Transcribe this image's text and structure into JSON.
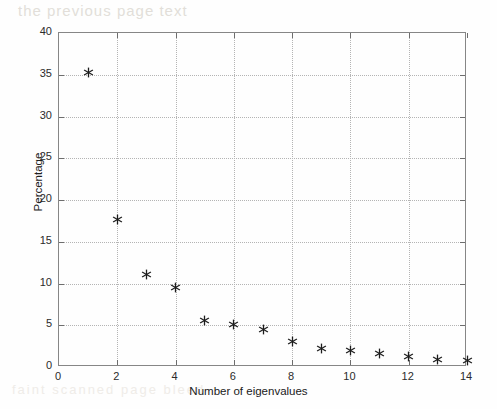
{
  "figure": {
    "background_color": "#fefefe",
    "axis_color": "#868686",
    "grid_color": "#b4b4b4",
    "marker_color": "#1d1d1d",
    "marker_symbol": "asterisk-marker"
  },
  "artifacts": {
    "top_bleed_text": "the previous page text",
    "bottom_bleed_text": "faint scanned page bleed"
  },
  "chart_data": {
    "type": "scatter",
    "title": "",
    "xlabel": "Number of eigenvalues",
    "ylabel": "Percentage",
    "xlim": [
      0,
      14
    ],
    "ylim": [
      0,
      40
    ],
    "xticks": [
      0,
      2,
      4,
      6,
      8,
      10,
      12,
      14
    ],
    "xticklabels": [
      "0",
      "2",
      "4",
      "6",
      "8",
      "10",
      "12",
      "14"
    ],
    "yticks": [
      0,
      5,
      10,
      15,
      20,
      25,
      30,
      35,
      40
    ],
    "yticklabels": [
      "0",
      "5",
      "10",
      "15",
      "20",
      "25",
      "30",
      "35",
      "40"
    ],
    "grid": true,
    "grid_style": "dotted",
    "legend": null,
    "marker": "*",
    "x": [
      1,
      2,
      3,
      4,
      5,
      6,
      7,
      8,
      9,
      10,
      11,
      12,
      13,
      14
    ],
    "y": [
      35.3,
      17.7,
      11.1,
      9.5,
      5.6,
      5.1,
      4.5,
      3.0,
      2.2,
      2.0,
      1.6,
      1.3,
      0.9,
      0.8
    ],
    "series": [
      {
        "name": "eigenvalue-percentage",
        "x": [
          1,
          2,
          3,
          4,
          5,
          6,
          7,
          8,
          9,
          10,
          11,
          12,
          13,
          14
        ],
        "values": [
          35.3,
          17.7,
          11.1,
          9.5,
          5.6,
          5.1,
          4.5,
          3.0,
          2.2,
          2.0,
          1.6,
          1.3,
          0.9,
          0.8
        ]
      }
    ]
  }
}
